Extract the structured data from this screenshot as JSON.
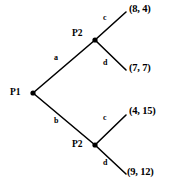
{
  "diagram": {
    "type": "game-tree",
    "stroke_color": "#000000",
    "text_color": "#000000",
    "background_color": "#ffffff"
  },
  "nodes": [
    {
      "id": "root",
      "label": "P1",
      "x": 33,
      "y": 93,
      "label_x": 10,
      "label_y": 88
    },
    {
      "id": "upper",
      "label": "P2",
      "x": 95,
      "y": 40,
      "label_x": 72,
      "label_y": 29
    },
    {
      "id": "lower",
      "label": "P2",
      "x": 95,
      "y": 145,
      "label_x": 72,
      "label_y": 140
    }
  ],
  "edges": [
    {
      "id": "root-to-upper",
      "label": "a",
      "from": "root",
      "to": "upper",
      "x1": 33,
      "y1": 93,
      "x2": 95,
      "y2": 40,
      "label_x": 54,
      "label_y": 54
    },
    {
      "id": "root-to-lower",
      "label": "b",
      "from": "root",
      "to": "lower",
      "x1": 33,
      "y1": 93,
      "x2": 95,
      "y2": 145,
      "label_x": 54,
      "label_y": 117
    },
    {
      "id": "upper-c",
      "label": "c",
      "from": "upper",
      "to": "p1",
      "x1": 95,
      "y1": 40,
      "x2": 126,
      "y2": 12,
      "label_x": 103,
      "label_y": 14
    },
    {
      "id": "upper-d",
      "label": "d",
      "from": "upper",
      "to": "p2",
      "x1": 95,
      "y1": 40,
      "x2": 126,
      "y2": 70,
      "label_x": 103,
      "label_y": 59
    },
    {
      "id": "lower-c",
      "label": "c",
      "from": "lower",
      "to": "p3",
      "x1": 95,
      "y1": 145,
      "x2": 126,
      "y2": 115,
      "label_x": 103,
      "label_y": 114
    },
    {
      "id": "lower-d",
      "label": "d",
      "from": "lower",
      "to": "p4",
      "x1": 95,
      "y1": 145,
      "x2": 126,
      "y2": 174,
      "label_x": 103,
      "label_y": 159
    }
  ],
  "payoffs": [
    {
      "id": "p1",
      "text": "(8, 4)",
      "player1": 8,
      "player2": 4,
      "x": 129,
      "y": 4,
      "path": "a,c"
    },
    {
      "id": "p2",
      "text": "(7, 7)",
      "player1": 7,
      "player2": 7,
      "x": 129,
      "y": 63,
      "path": "a,d"
    },
    {
      "id": "p3",
      "text": "(4, 15)",
      "player1": 4,
      "player2": 15,
      "x": 129,
      "y": 106,
      "path": "b,c"
    },
    {
      "id": "p4",
      "text": "(9, 12)",
      "player1": 9,
      "player2": 12,
      "x": 127,
      "y": 167,
      "path": "b,d"
    }
  ]
}
